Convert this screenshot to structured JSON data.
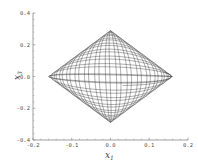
{
  "chart_data": {
    "type": "line",
    "title": "",
    "xlabel": "x1",
    "ylabel": "x3",
    "xlim": [
      -0.2,
      0.2
    ],
    "ylim": [
      -0.4,
      0.4
    ],
    "xticks": [
      "-0.2",
      "-0.1",
      "0.0",
      "0.1",
      "0.2"
    ],
    "yticks": [
      "0.4",
      "0.2",
      "0.0",
      "-0.2",
      "-0.4"
    ],
    "grid": false,
    "legend": null,
    "series": [
      {
        "name": "trajectory",
        "description": "Quasi-periodic trajectory densely filling a diamond-shaped region",
        "envelope_vertices": [
          [
            -0.16,
            0.0
          ],
          [
            0.0,
            0.29
          ],
          [
            0.16,
            0.0
          ],
          [
            0.0,
            -0.29
          ]
        ],
        "color": "#222222"
      }
    ]
  },
  "labels": {
    "x_main": "x",
    "x_sub": "1",
    "y_main": "x",
    "y_sub": "3"
  }
}
